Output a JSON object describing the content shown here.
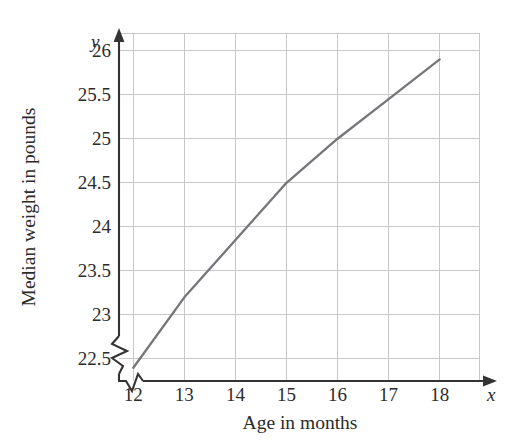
{
  "chart_data": {
    "type": "line",
    "title": "",
    "xlabel": "Age in months",
    "ylabel": "Median weight in pounds",
    "x_axis_variable": "x",
    "y_axis_variable": "y",
    "x": [
      12,
      13,
      14,
      15,
      16,
      17,
      18
    ],
    "values": [
      22.4,
      23.2,
      23.85,
      24.5,
      25.0,
      25.45,
      25.9
    ],
    "series": [
      {
        "name": "Median weight",
        "color": "#75767a",
        "values": [
          22.4,
          23.2,
          23.85,
          24.5,
          25.0,
          25.45,
          25.9
        ]
      }
    ],
    "xlim": [
      11.72,
      18.77
    ],
    "ylim": [
      22.25,
      26.2
    ],
    "x_tick_labels": [
      "12",
      "13",
      "14",
      "15",
      "16",
      "17",
      "18"
    ],
    "y_tick_labels": [
      "22.5",
      "23",
      "23.5",
      "24",
      "24.5",
      "25",
      "25.5",
      "26"
    ],
    "y_tick_values": [
      22.5,
      23,
      23.5,
      24,
      24.5,
      25,
      25.5,
      26
    ],
    "grid": true,
    "legend": false,
    "legend_position": "none",
    "axis_break_x": true,
    "axis_break_y": true,
    "annotations": []
  },
  "colors": {
    "background": "#ffffff",
    "line": "#75767a",
    "grid": "#c9c9c9",
    "axis": "#333333",
    "text": "#2b2b2b"
  }
}
